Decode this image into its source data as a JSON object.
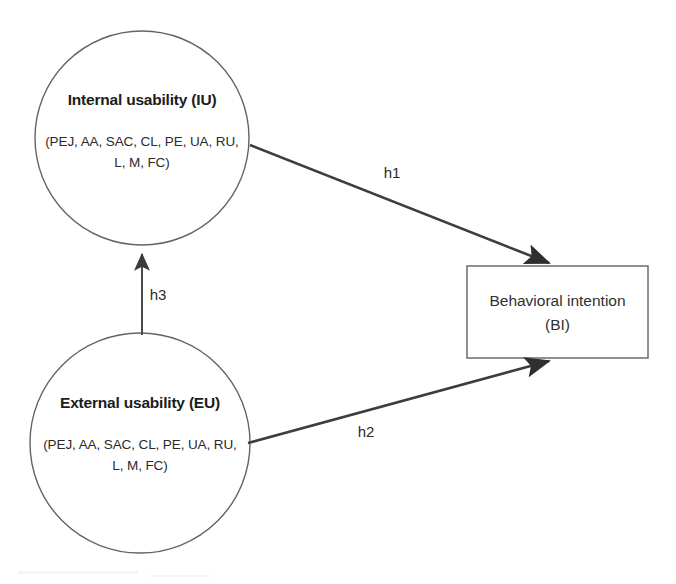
{
  "diagram": {
    "type": "conceptual-model-diagram",
    "background_color": "#ffffff",
    "line_color": "#3d3d3d",
    "shape_stroke_color": "#646464",
    "text_color": "#1c1c1c",
    "nodes": [
      {
        "id": "internal-usability",
        "shape": "circle",
        "title": "Internal usability (IU)",
        "subtitle_line1": "(PEJ, AA, SAC, CL, PE, UA, RU,",
        "subtitle_line2": "L, M, FC)",
        "cx": 142,
        "cy": 138,
        "r": 107
      },
      {
        "id": "external-usability",
        "shape": "circle",
        "title": "External usability (EU)",
        "subtitle_line1": "(PEJ, AA, SAC, CL, PE, UA, RU,",
        "subtitle_line2": "L, M, FC)",
        "cx": 140,
        "cy": 443,
        "r": 110
      },
      {
        "id": "behavioral-intention",
        "shape": "rectangle",
        "title_line1": "Behavioral intention",
        "title_line2": "(BI)",
        "x": 467,
        "y": 266,
        "width": 181,
        "height": 92
      }
    ],
    "edges": [
      {
        "id": "h1",
        "label": "h1",
        "from": "internal-usability",
        "to": "behavioral-intention",
        "label_x": 392,
        "label_y": 178
      },
      {
        "id": "h2",
        "label": "h2",
        "from": "external-usability",
        "to": "behavioral-intention",
        "label_x": 366,
        "label_y": 437
      },
      {
        "id": "h3",
        "label": "h3",
        "from": "external-usability",
        "to": "internal-usability",
        "label_x": 158,
        "label_y": 300
      }
    ]
  }
}
